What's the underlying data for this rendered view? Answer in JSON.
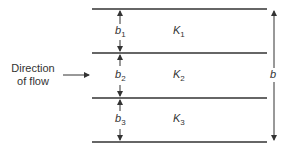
{
  "diagram": {
    "flow_label_line1": "Direction",
    "flow_label_line2": "of flow",
    "layers": [
      {
        "thickness_label": "b",
        "thickness_sub": "1",
        "perm_label": "K",
        "perm_sub": "1"
      },
      {
        "thickness_label": "b",
        "thickness_sub": "2",
        "perm_label": "K",
        "perm_sub": "2"
      },
      {
        "thickness_label": "b",
        "thickness_sub": "3",
        "perm_label": "K",
        "perm_sub": "3"
      }
    ],
    "total_thickness_label": "b",
    "line_color": "#333333"
  }
}
